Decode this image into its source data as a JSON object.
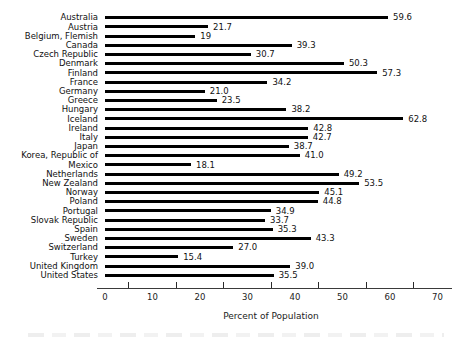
{
  "chart_data": {
    "type": "bar",
    "orientation": "horizontal",
    "title": "",
    "xlabel": "Percent of Population",
    "ylabel": "",
    "xlim": [
      0,
      70
    ],
    "xticks": [
      0,
      10,
      20,
      30,
      40,
      50,
      60,
      70
    ],
    "minor_ticks": [
      5,
      15,
      25,
      35,
      45,
      55,
      65
    ],
    "grid": false,
    "legend": false,
    "bar_color": "#000000",
    "text_color": "#1a1a1a",
    "categories": [
      "Australia",
      "Austria",
      "Belgium, Flemish",
      "Canada",
      "Czech Republic",
      "Denmark",
      "Finland",
      "France",
      "Germany",
      "Greece",
      "Hungary",
      "Iceland",
      "Ireland",
      "Italy",
      "Japan",
      "Korea, Republic of",
      "Mexico",
      "Netherlands",
      "New Zealand",
      "Norway",
      "Poland",
      "Portugal",
      "Slovak Republic",
      "Spain",
      "Sweden",
      "Switzerland",
      "Turkey",
      "United Kingdom",
      "United States"
    ],
    "values": [
      59.6,
      21.7,
      19,
      39.3,
      30.7,
      50.3,
      57.3,
      34.2,
      21.0,
      23.5,
      38.2,
      62.8,
      42.8,
      42.7,
      38.7,
      41.0,
      18.1,
      49.2,
      53.5,
      45.1,
      44.8,
      34.9,
      33.7,
      35.3,
      43.3,
      27.0,
      15.4,
      39.0,
      35.5
    ],
    "value_labels": [
      "59.6",
      "21.7",
      "19",
      "39.3",
      "30.7",
      "50.3",
      "57.3",
      "34.2",
      "21.0",
      "23.5",
      "38.2",
      "62.8",
      "42.8",
      "42.7",
      "38.7",
      "41.0",
      "18.1",
      "49.2",
      "53.5",
      "45.1",
      "44.8",
      "34.9",
      "33.7",
      "35.3",
      "43.3",
      "27.0",
      "15.4",
      "39.0",
      "35.5"
    ]
  }
}
